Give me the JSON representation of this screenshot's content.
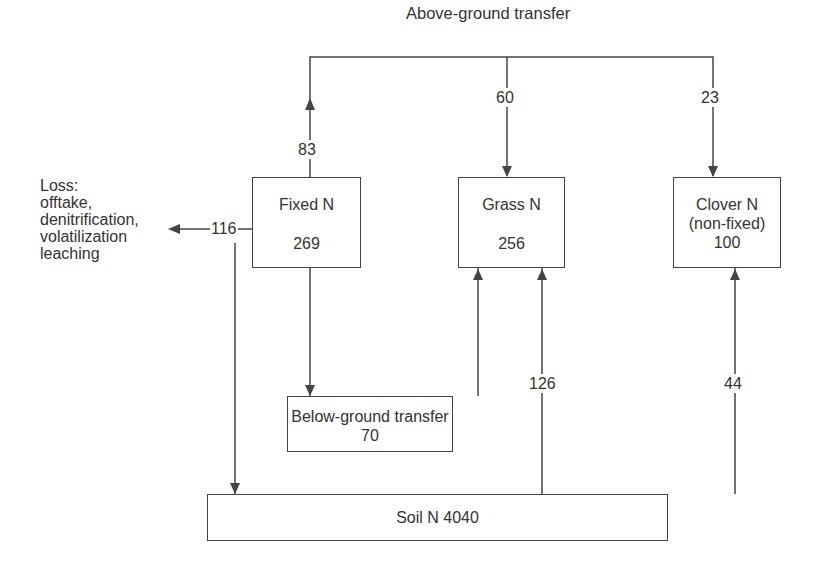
{
  "top_label": "Above-ground transfer",
  "loss": {
    "lines": [
      "Loss:",
      "offtake,",
      "denitrification,",
      "volatilization",
      "leaching"
    ],
    "value": "116"
  },
  "nodes": {
    "fixed_n": {
      "label": "Fixed N",
      "value": "269"
    },
    "grass_n": {
      "label": "Grass N",
      "value": "256"
    },
    "clover_n": {
      "label": "Clover N",
      "sublabel": "(non-fixed)",
      "value": "100"
    },
    "below_ground": {
      "label": "Below-ground transfer",
      "value": "70"
    },
    "soil_n": {
      "label": "Soil N 4040"
    }
  },
  "flows": {
    "fixed_to_above": "83",
    "above_to_grass": "60",
    "above_to_clover": "23",
    "soil_to_grass": "126",
    "soil_to_clover": "44"
  },
  "colors": {
    "line": "#444444",
    "text": "#333333",
    "background": "#ffffff"
  }
}
